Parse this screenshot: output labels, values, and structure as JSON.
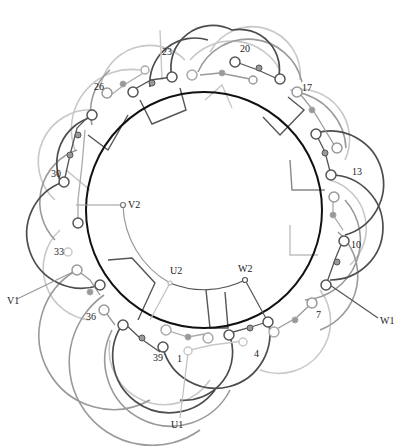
{
  "diagram": {
    "type": "stator-winding-diagram",
    "colors": {
      "dark": "#4a4a4a",
      "mid": "#8a8a8a",
      "light": "#c4c4c4",
      "ring": "#111111"
    },
    "slot_labels": [
      {
        "text": "1",
        "x": 177,
        "y": 362
      },
      {
        "text": "4",
        "x": 254,
        "y": 357
      },
      {
        "text": "7",
        "x": 316,
        "y": 318
      },
      {
        "text": "10",
        "x": 351,
        "y": 248
      },
      {
        "text": "13",
        "x": 352,
        "y": 175
      },
      {
        "text": "17",
        "x": 302,
        "y": 91
      },
      {
        "text": "20",
        "x": 240,
        "y": 52
      },
      {
        "text": "23",
        "x": 162,
        "y": 55
      },
      {
        "text": "26",
        "x": 94,
        "y": 90
      },
      {
        "text": "30",
        "x": 51,
        "y": 177
      },
      {
        "text": "33",
        "x": 54,
        "y": 255
      },
      {
        "text": "36",
        "x": 86,
        "y": 320
      },
      {
        "text": "39",
        "x": 153,
        "y": 361
      }
    ],
    "terminals": [
      {
        "text": "U1",
        "x": 171,
        "y": 428
      },
      {
        "text": "U2",
        "x": 170,
        "y": 274
      },
      {
        "text": "V1",
        "x": 7,
        "y": 304
      },
      {
        "text": "V2",
        "x": 128,
        "y": 208
      },
      {
        "text": "W1",
        "x": 380,
        "y": 324
      },
      {
        "text": "W2",
        "x": 238,
        "y": 272
      }
    ]
  }
}
